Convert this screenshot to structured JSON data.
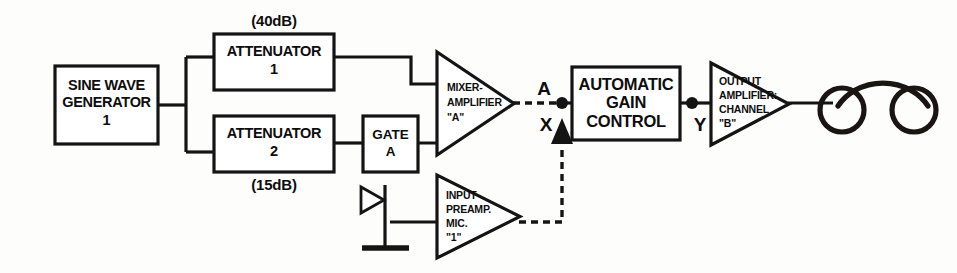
{
  "diagram": {
    "colors": {
      "line": "#141414",
      "background": "#fdfdfc",
      "fill": "#ffffff"
    },
    "blocks": {
      "sine_generator": {
        "line1": "SINE WAVE",
        "line2": "GENERATOR",
        "line3": "1"
      },
      "attenuator_1": {
        "line1": "ATTENUATOR",
        "line2": "1",
        "gain_label": "(40dB)"
      },
      "attenuator_2": {
        "line1": "ATTENUATOR",
        "line2": "2",
        "gain_label": "(15dB)"
      },
      "gate_a": {
        "line1": "GATE",
        "line2": "A"
      },
      "mixer_amplifier": {
        "line1": "MIXER-",
        "line2": "AMPLIFIER",
        "line3": "\"A\""
      },
      "agc": {
        "line1": "AUTOMATIC",
        "line2": "GAIN",
        "line3": "CONTROL"
      },
      "output_amplifier": {
        "line1": "OUTPUT",
        "line2": "AMPLIFIER:",
        "line3": "CHANNEL",
        "line4": "\"B\""
      },
      "input_preamp": {
        "line1": "INPUT",
        "line2": "PREAMP.",
        "line3": "MIC.",
        "line4": "\"1\""
      }
    },
    "nodes": {
      "a": "A",
      "x": "X",
      "y": "Y"
    },
    "symbols": {
      "microphone": "microphone-icon",
      "headphones": "headphones-icon"
    }
  }
}
